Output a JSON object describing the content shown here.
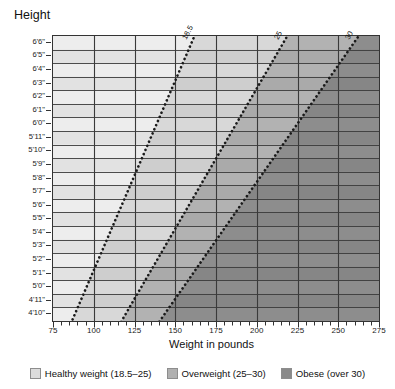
{
  "chart_data": {
    "type": "line",
    "title": "",
    "xlabel": "Weight in pounds",
    "ylabel": "Height",
    "xlim": [
      75,
      275
    ],
    "ylim_labels": [
      "4'10\"",
      "6'6\""
    ],
    "grid": true,
    "legend_position": "bottom",
    "x_ticks": [
      75,
      100,
      125,
      150,
      175,
      200,
      225,
      250,
      275
    ],
    "x_minor_per_major": 5,
    "y_ticks": [
      "6'6\"",
      "6'5\"",
      "6'4\"",
      "6'3\"",
      "6'2\"",
      "6'1\"",
      "6'0\"",
      "5'11\"",
      "5'10\"",
      "5'9\"",
      "5'8\"",
      "5'7\"",
      "5'6\"",
      "5'5\"",
      "5'4\"",
      "5'3\"",
      "5'2\"",
      "5'1\"",
      "5'0\"",
      "4'11\"",
      "4'10\""
    ],
    "y_heights_inches": [
      78,
      77,
      76,
      75,
      74,
      73,
      72,
      71,
      70,
      69,
      68,
      67,
      66,
      65,
      64,
      63,
      62,
      61,
      60,
      59,
      58
    ],
    "series": [
      {
        "name": "BMI 18.5",
        "label": "18.5",
        "style": "dotted",
        "points": [
          {
            "height_in": 58,
            "weight_lb": 88.4
          },
          {
            "height_in": 62,
            "weight_lb": 101.0
          },
          {
            "height_in": 66,
            "weight_lb": 114.4
          },
          {
            "height_in": 70,
            "weight_lb": 128.8
          },
          {
            "height_in": 74,
            "weight_lb": 144.0
          },
          {
            "height_in": 78,
            "weight_lb": 160.0
          }
        ]
      },
      {
        "name": "BMI 25",
        "label": "25",
        "style": "dotted",
        "points": [
          {
            "height_in": 58,
            "weight_lb": 119.5
          },
          {
            "height_in": 62,
            "weight_lb": 136.5
          },
          {
            "height_in": 66,
            "weight_lb": 154.7
          },
          {
            "height_in": 70,
            "weight_lb": 174.0
          },
          {
            "height_in": 74,
            "weight_lb": 194.6
          },
          {
            "height_in": 78,
            "weight_lb": 216.3
          }
        ]
      },
      {
        "name": "BMI 30",
        "label": "30",
        "style": "dotted",
        "points": [
          {
            "height_in": 58,
            "weight_lb": 143.4
          },
          {
            "height_in": 62,
            "weight_lb": 163.8
          },
          {
            "height_in": 66,
            "weight_lb": 185.6
          },
          {
            "height_in": 70,
            "weight_lb": 208.8
          },
          {
            "height_in": 74,
            "weight_lb": 233.5
          },
          {
            "height_in": 78,
            "weight_lb": 259.6
          }
        ]
      }
    ],
    "zones": [
      {
        "name": "Healthy weight",
        "range": "18.5-25",
        "color": "#d9d9d9"
      },
      {
        "name": "Overweight",
        "range": "25-30",
        "color": "#b4b4b4"
      },
      {
        "name": "Obese",
        "range": "over 30",
        "color": "#8f8f8f"
      }
    ]
  },
  "axes": {
    "y_title": "Height",
    "x_title": "Weight in pounds",
    "x_tick_labels": [
      "75",
      "100",
      "125",
      "150",
      "175",
      "200",
      "225",
      "250",
      "275"
    ],
    "y_tick_labels": [
      "6'6\"",
      "6'5\"",
      "6'4\"",
      "6'3\"",
      "6'2\"",
      "6'1\"",
      "6'0\"",
      "5'11\"",
      "5'10\"",
      "5'9\"",
      "5'8\"",
      "5'7\"",
      "5'6\"",
      "5'5\"",
      "5'4\"",
      "5'3\"",
      "5'2\"",
      "5'1\"",
      "5'0\"",
      "4'11\"",
      "4'10\""
    ]
  },
  "curve_labels": [
    {
      "text": "18.5"
    },
    {
      "text": "25"
    },
    {
      "text": "30"
    }
  ],
  "legend": {
    "items": [
      {
        "label": "Healthy weight (18.5–25)",
        "color": "#dcdcdc"
      },
      {
        "label": "Overweight (25–30)",
        "color": "#b0b0b0"
      },
      {
        "label": "Obese (over 30)",
        "color": "#8a8a8a"
      }
    ]
  },
  "colors": {
    "zone_underweight": "#ededed",
    "zone_healthy": "#d8d8d8",
    "zone_overweight": "#b2b2b2",
    "zone_obese": "#8d8d8d",
    "band_alt": "rgba(0,0,0,0.045)",
    "gridline": "#3a3a3a",
    "axis": "#333333",
    "dotline": "#1a1a1a"
  }
}
